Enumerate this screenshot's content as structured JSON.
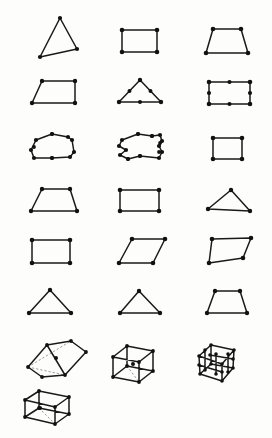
{
  "sheet": {
    "title": "Polygon and polyhedron mesh figure sheet",
    "width": 272,
    "height": 438,
    "background_color": "#fdfdfc",
    "line_color": "#1a1a1a",
    "vertex_color": "#111111",
    "hidden_edge_color": "#8d8d8d",
    "figure_count": 19,
    "rows": 7,
    "columns": 3
  },
  "figures": [
    {
      "id": "fig-1",
      "label": "triangle-skewed",
      "row": 1,
      "column": 1,
      "kind": "polygon-2d",
      "sides": 3,
      "vertex_count": 3,
      "vertex_radius": 2.1,
      "points": "60,18 77,49 40,57",
      "closed": true,
      "extra_points": ""
    },
    {
      "id": "fig-2",
      "label": "rectangle-plain",
      "row": 1,
      "column": 2,
      "kind": "polygon-2d",
      "sides": 4,
      "vertex_count": 4,
      "vertex_radius": 2.3,
      "points": "122,30 157,30 157,52 122,52",
      "closed": true,
      "extra_points": ""
    },
    {
      "id": "fig-3",
      "label": "trapezoid-wide-base",
      "row": 1,
      "column": 3,
      "kind": "polygon-2d",
      "sides": 4,
      "vertex_count": 4,
      "vertex_radius": 2.3,
      "points": "213,29 241,29 248,53 206,53",
      "closed": true,
      "extra_points": ""
    },
    {
      "id": "fig-4",
      "label": "trapezoid-right-leaning",
      "row": 2,
      "column": 1,
      "kind": "polygon-2d",
      "sides": 4,
      "vertex_count": 4,
      "vertex_radius": 2.2,
      "points": "42,81 75,81 75,103 32,103",
      "closed": true,
      "extra_points": ""
    },
    {
      "id": "fig-5",
      "label": "triangle-with-edge-midpoints",
      "row": 2,
      "column": 2,
      "kind": "polygon-2d",
      "sides": 3,
      "vertex_count": 3,
      "vertex_radius": 2.2,
      "points": "140,80 161,102 119,102",
      "closed": true,
      "extra_points": "129.5,91 150.5,91 140,102"
    },
    {
      "id": "fig-6",
      "label": "rectangle-with-edge-midpoints",
      "row": 2,
      "column": 3,
      "kind": "polygon-2d",
      "sides": 4,
      "vertex_count": 4,
      "vertex_radius": 2.3,
      "points": "209,82 250,82 250,104 209,104",
      "closed": true,
      "extra_points": "229.5,82 250,93 229.5,104 209,93"
    },
    {
      "id": "fig-7",
      "label": "quadrilateral-curved-edges",
      "row": 3,
      "column": 1,
      "kind": "polygon-2d-distorted",
      "sides": 4,
      "vertex_count": 4,
      "vertex_radius": 2.1,
      "points": "36,140 52,134 68,137 72,140 74,152 70,157 52,158 34,158 31,150",
      "closed": true,
      "extra_points": "52,134 52,158 34,147"
    },
    {
      "id": "fig-8",
      "label": "quadrilateral-wavy-edges",
      "row": 3,
      "column": 2,
      "kind": "polygon-2d-distorted",
      "sides": 4,
      "vertex_count": 4,
      "vertex_radius": 2.1,
      "points": "122,140 138,134 152,136 160,135 162,141 159,146 162,152 159,158 140,156 128,159 120,155 126,150 119,146",
      "closed": true,
      "extra_points": "138,134 152,136 140,156 128,159 160,143 159,152"
    },
    {
      "id": "fig-9",
      "label": "square-small",
      "row": 3,
      "column": 3,
      "kind": "polygon-2d",
      "sides": 4,
      "vertex_count": 4,
      "vertex_radius": 2.3,
      "points": "213,138 242,138 242,159 213,159",
      "closed": true,
      "extra_points": ""
    },
    {
      "id": "fig-10",
      "label": "trapezoid-isosceles",
      "row": 4,
      "column": 1,
      "kind": "polygon-2d",
      "sides": 4,
      "vertex_count": 4,
      "vertex_radius": 2.2,
      "points": "42,189 70,189 77,211 31,211",
      "closed": true,
      "extra_points": ""
    },
    {
      "id": "fig-11",
      "label": "rectangle-wide",
      "row": 4,
      "column": 2,
      "kind": "polygon-2d",
      "sides": 4,
      "vertex_count": 4,
      "vertex_radius": 2.3,
      "points": "120,190 159,190 159,211 120,211",
      "closed": true,
      "extra_points": ""
    },
    {
      "id": "fig-12",
      "label": "triangle-flat-wide",
      "row": 4,
      "column": 3,
      "kind": "polygon-2d",
      "sides": 3,
      "vertex_count": 3,
      "vertex_radius": 2.2,
      "points": "231,190 250,211 208,209",
      "closed": true,
      "extra_points": ""
    },
    {
      "id": "fig-13",
      "label": "rectangle-medium",
      "row": 5,
      "column": 1,
      "kind": "polygon-2d",
      "sides": 4,
      "vertex_count": 4,
      "vertex_radius": 2.3,
      "points": "32,240 70,240 70,263 32,263",
      "closed": true,
      "extra_points": ""
    },
    {
      "id": "fig-14",
      "label": "parallelogram-slanted",
      "row": 5,
      "column": 2,
      "kind": "polygon-2d",
      "sides": 4,
      "vertex_count": 4,
      "vertex_radius": 2.3,
      "points": "132,239 165,239 153,263 119,263",
      "closed": true,
      "extra_points": ""
    },
    {
      "id": "fig-15",
      "label": "quadrilateral-irregular",
      "row": 5,
      "column": 3,
      "kind": "polygon-2d",
      "sides": 4,
      "vertex_count": 4,
      "vertex_radius": 2.3,
      "points": "212,239 251,238 243,258 209,263",
      "closed": true,
      "extra_points": ""
    },
    {
      "id": "fig-16",
      "label": "triangle-isosceles-tall",
      "row": 6,
      "column": 1,
      "kind": "polygon-2d",
      "sides": 3,
      "vertex_count": 3,
      "vertex_radius": 2.2,
      "points": "50,290 71,313 29,313",
      "closed": true,
      "extra_points": ""
    },
    {
      "id": "fig-17",
      "label": "triangle-isosceles-short",
      "row": 6,
      "column": 2,
      "kind": "polygon-2d",
      "sides": 3,
      "vertex_count": 3,
      "vertex_radius": 2.2,
      "points": "139,291 160,313 120,313",
      "closed": true,
      "extra_points": ""
    },
    {
      "id": "fig-18",
      "label": "trapezoid-row6",
      "row": 6,
      "column": 3,
      "kind": "polygon-2d",
      "sides": 4,
      "vertex_count": 4,
      "vertex_radius": 2.2,
      "points": "215,291 240,291 247,313 207,313",
      "closed": true,
      "extra_points": ""
    },
    {
      "id": "fig-19",
      "label": "prism-tilted-3d",
      "row": 7,
      "column": 1,
      "kind": "polyhedron-3d",
      "vertex_count": 6,
      "vertex_radius": 1.9,
      "visible_edges": "M28,367 L47,345 L71,341 L86,352 L65,375 L42,377 Z M47,345 L65,375 M71,341 L86,352",
      "hidden_edges": "M28,367 L65,375 M28,367 L71,341",
      "points": "28,367 47,345 71,341 86,352 65,375 42,377",
      "center_point": "56,358"
    },
    {
      "id": "fig-20",
      "label": "cuboid-wireframe-3d",
      "row": 7,
      "column": 2,
      "kind": "polyhedron-3d",
      "vertex_count": 8,
      "vertex_radius": 1.9,
      "visible_edges": "M113,357 L113,377 L139,382 L139,362 Z M113,357 L127,346 L153,351 L139,362 M153,351 L153,371 L139,382 M127,346 L127,366 L113,377 M127,366 L153,371",
      "hidden_edges": "M127,366 L139,382",
      "points": "113,357 113,377 139,382 139,362 127,346 153,351 153,371 127,366",
      "center_point": "133,364"
    },
    {
      "id": "fig-21",
      "label": "lattice-box-dense-nodes-3d",
      "row": 7,
      "column": 3,
      "kind": "polyhedron-3d-mesh",
      "vertex_count": 18,
      "vertex_radius": 1.8,
      "visible_edges": "M199,356 L200,374 L222,381 L222,364 Z M199,356 L211,345 L234,350 L222,364 M234,350 L233,368 L222,381 M211,345 L211,364 L200,374 M211,364 L233,368 M199,365 L222,372 M210,355 L233,359 M205,350 L205,370 M216,354 L216,374 M228,354 L228,372",
      "hidden_edges": "",
      "points": "199,356 200,374 222,381 222,364 211,345 234,350 233,368 211,364 199,365 210,355 205,350 216,354 228,354 205,370 216,374 228,372 222,372 233,359",
      "center_point": ""
    },
    {
      "id": "fig-22",
      "label": "cuboid-flat-3d",
      "row": 8,
      "column": 1,
      "kind": "polyhedron-3d",
      "vertex_count": 8,
      "vertex_radius": 1.9,
      "visible_edges": "M25,400 L25,417 L55,424 L55,407 Z M25,400 L39,391 L69,397 L55,407 M69,397 L69,414 L55,424 M39,391 L39,408 L25,417 M39,408 L69,414",
      "hidden_edges": "M39,408 L55,424",
      "points": "25,400 25,417 55,424 55,407 39,391 69,397 69,414 39,408",
      "center_point": "40,408"
    }
  ]
}
